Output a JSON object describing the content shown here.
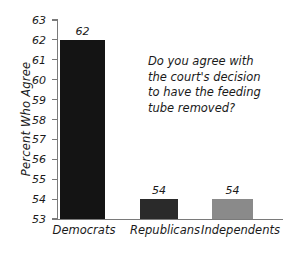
{
  "chart_data": {
    "type": "bar",
    "title": "",
    "subtitle": "",
    "xlabel": "",
    "ylabel": "Percent Who Agree",
    "categories": [
      "Democrats",
      "Republicans",
      "Independents"
    ],
    "values": [
      62,
      54,
      54
    ],
    "value_labels": [
      "62",
      "54",
      "54"
    ],
    "bar_colors": [
      "#141414",
      "#2a2a2a",
      "#8a8a8a"
    ],
    "ylim": [
      53,
      63
    ],
    "yticks": [
      53,
      54,
      55,
      56,
      57,
      58,
      59,
      60,
      61,
      62,
      63
    ],
    "ytick_labels": [
      "53",
      "54",
      "55",
      "56",
      "57",
      "58",
      "59",
      "60",
      "61",
      "62",
      "63"
    ],
    "grid": false,
    "legend": false,
    "legend_position": "none",
    "annotations": [
      {
        "name": "survey-question",
        "lines": [
          "Do you agree with",
          "the court's decision",
          "to have the feeding",
          "tube removed?"
        ]
      }
    ]
  },
  "colors": {
    "axis": "#7a7a7a",
    "text": "#1a1a1a",
    "background": "#ffffff"
  }
}
